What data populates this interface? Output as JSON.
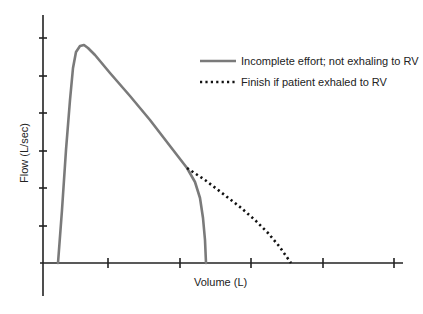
{
  "chart_data": {
    "type": "line",
    "title": "",
    "xlabel": "Volume (L)",
    "ylabel": "Flow (L/sec)",
    "x_ticks_count": 5,
    "y_ticks_count": 6,
    "tick_labels_shown": false,
    "grid": false,
    "legend_position": "upper right",
    "series": [
      {
        "name": "Incomplete effort; not exhaling to RV",
        "style": "solid",
        "color": "#7a7a7a",
        "points_px": [
          [
            58,
            263
          ],
          [
            62,
            210
          ],
          [
            66,
            150
          ],
          [
            70,
            100
          ],
          [
            73,
            68
          ],
          [
            76,
            52
          ],
          [
            80,
            46
          ],
          [
            84,
            45
          ],
          [
            88,
            48
          ],
          [
            95,
            55
          ],
          [
            110,
            73
          ],
          [
            130,
            96
          ],
          [
            150,
            120
          ],
          [
            170,
            146
          ],
          [
            187,
            168
          ],
          [
            195,
            182
          ],
          [
            200,
            198
          ],
          [
            203,
            218
          ],
          [
            205,
            240
          ],
          [
            206,
            263
          ]
        ]
      },
      {
        "name": "Finish if patient exhaled to RV",
        "style": "dotted",
        "color": "#111111",
        "points_px": [
          [
            187,
            168
          ],
          [
            205,
            180
          ],
          [
            222,
            193
          ],
          [
            240,
            207
          ],
          [
            255,
            220
          ],
          [
            268,
            233
          ],
          [
            279,
            246
          ],
          [
            291,
            263
          ]
        ]
      }
    ],
    "axes_px": {
      "origin": [
        43,
        263
      ],
      "y_top": 15,
      "y_bottom": 296,
      "x_left": 40,
      "x_right": 403,
      "y_tick_positions": [
        38,
        76,
        113,
        151,
        188,
        226
      ],
      "x_tick_positions": [
        108,
        180,
        251,
        323,
        394
      ]
    }
  },
  "legend": {
    "items": [
      {
        "label": "Incomplete effort; not exhaling to RV",
        "style": "solid"
      },
      {
        "label": "Finish if patient exhaled to RV",
        "style": "dotted"
      }
    ]
  },
  "labels": {
    "x": "Volume (L)",
    "y": "Flow (L/sec)"
  },
  "colors": {
    "axis": "#222222",
    "solid_curve": "#7a7a7a",
    "dotted_curve": "#111111"
  }
}
